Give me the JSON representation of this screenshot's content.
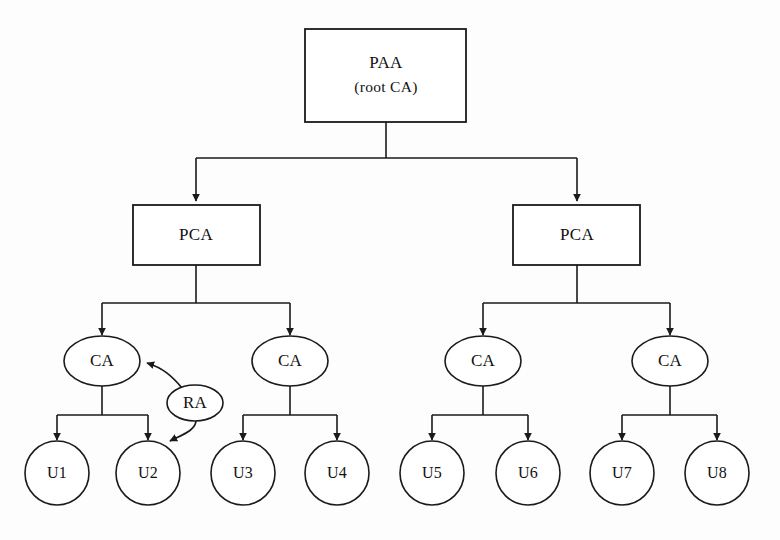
{
  "diagram": {
    "background_color": "#fdfdfd",
    "stroke_color": "#1a1a1a",
    "fill_color": "#ffffff",
    "nodes": {
      "root": {
        "id": "paa",
        "shape": "rectangle",
        "line1": "PAA",
        "line2": "(root CA)"
      },
      "pca_left": {
        "id": "pca-left",
        "shape": "rectangle",
        "label": "PCA"
      },
      "pca_right": {
        "id": "pca-right",
        "shape": "rectangle",
        "label": "PCA"
      },
      "ca1": {
        "id": "ca-1",
        "shape": "ellipse",
        "label": "CA"
      },
      "ca2": {
        "id": "ca-2",
        "shape": "ellipse",
        "label": "CA"
      },
      "ca3": {
        "id": "ca-3",
        "shape": "ellipse",
        "label": "CA"
      },
      "ca4": {
        "id": "ca-4",
        "shape": "ellipse",
        "label": "CA"
      },
      "ra": {
        "id": "ra",
        "shape": "ellipse",
        "label": "RA"
      },
      "users": [
        {
          "id": "u1",
          "shape": "circle",
          "label": "U1"
        },
        {
          "id": "u2",
          "shape": "circle",
          "label": "U2"
        },
        {
          "id": "u3",
          "shape": "circle",
          "label": "U3"
        },
        {
          "id": "u4",
          "shape": "circle",
          "label": "U4"
        },
        {
          "id": "u5",
          "shape": "circle",
          "label": "U5"
        },
        {
          "id": "u6",
          "shape": "circle",
          "label": "U6"
        },
        {
          "id": "u7",
          "shape": "circle",
          "label": "U7"
        },
        {
          "id": "u8",
          "shape": "circle",
          "label": "U8"
        }
      ]
    },
    "edges": [
      {
        "from": "paa",
        "to": "pca-left",
        "arrow": true
      },
      {
        "from": "paa",
        "to": "pca-right",
        "arrow": true
      },
      {
        "from": "pca-left",
        "to": "ca-1",
        "arrow": true
      },
      {
        "from": "pca-left",
        "to": "ca-2",
        "arrow": true
      },
      {
        "from": "pca-right",
        "to": "ca-3",
        "arrow": true
      },
      {
        "from": "pca-right",
        "to": "ca-4",
        "arrow": true
      },
      {
        "from": "ca-1",
        "to": "u1",
        "arrow": true
      },
      {
        "from": "ca-1",
        "to": "u2",
        "arrow": true
      },
      {
        "from": "ca-2",
        "to": "u3",
        "arrow": true
      },
      {
        "from": "ca-2",
        "to": "u4",
        "arrow": true
      },
      {
        "from": "ca-3",
        "to": "u5",
        "arrow": true
      },
      {
        "from": "ca-3",
        "to": "u6",
        "arrow": true
      },
      {
        "from": "ca-4",
        "to": "u7",
        "arrow": true
      },
      {
        "from": "ca-4",
        "to": "u8",
        "arrow": true
      },
      {
        "from": "ra",
        "to": "ca-1",
        "arrow": true,
        "style": "curved"
      },
      {
        "from": "ra",
        "to": "u2",
        "arrow": true,
        "style": "curved"
      }
    ]
  }
}
